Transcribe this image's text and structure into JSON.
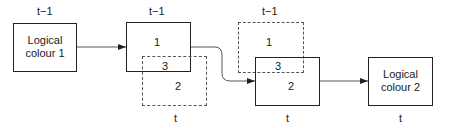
{
  "diagram": {
    "stage1": {
      "time_label": "t−1",
      "box_label_line1": "Logical",
      "box_label_line2": "colour 1"
    },
    "stage2": {
      "top_time_label": "t−1",
      "bottom_time_label": "t",
      "region_1": "1",
      "region_3": "3",
      "region_2": "2"
    },
    "stage3": {
      "top_time_label": "t−1",
      "bottom_time_label": "t",
      "region_1": "1",
      "region_3": "3",
      "region_2": "2"
    },
    "stage4": {
      "time_label": "t",
      "box_label_line1": "Logical",
      "box_label_line2": "colour 2"
    },
    "colors": {
      "line": "#222222",
      "dashed": "#555555"
    }
  }
}
